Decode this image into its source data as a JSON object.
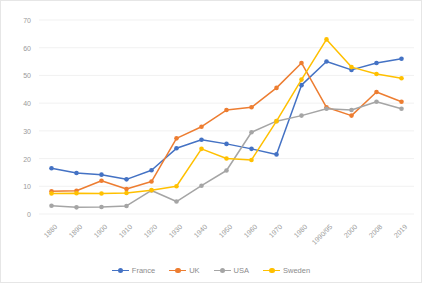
{
  "chart_data": {
    "type": "line",
    "title": "",
    "xlabel": "",
    "ylabel": "",
    "ylim": [
      0,
      70
    ],
    "yticks": [
      0,
      10,
      20,
      30,
      40,
      50,
      60,
      70
    ],
    "grid": true,
    "legend_position": "bottom",
    "categories": [
      "1880",
      "1890",
      "1900",
      "1910",
      "1920",
      "1930",
      "1940",
      "1950",
      "1960",
      "1970",
      "1980",
      "1990/95",
      "2000",
      "2008",
      "2019"
    ],
    "series": [
      {
        "name": "France",
        "color": "#4472C4",
        "values": [
          16.5,
          14.8,
          14.2,
          12.5,
          15.8,
          23.7,
          26.8,
          25.3,
          23.5,
          21.5,
          46.5,
          55.0,
          52.0,
          54.5,
          56.0
        ]
      },
      {
        "name": "UK",
        "color": "#ED7D31",
        "values": [
          8.2,
          8.4,
          12.0,
          9.0,
          11.7,
          27.3,
          31.5,
          37.5,
          38.5,
          45.5,
          54.5,
          38.5,
          35.5,
          44.0,
          40.5
        ]
      },
      {
        "name": "USA",
        "color": "#A5A5A5",
        "values": [
          3.0,
          2.4,
          2.5,
          2.9,
          8.5,
          4.5,
          10.2,
          15.7,
          29.5,
          33.5,
          35.5,
          38.0,
          37.5,
          40.5,
          38.0
        ]
      },
      {
        "name": "Sweden",
        "color": "#FFC000",
        "values": [
          7.4,
          7.5,
          7.4,
          7.6,
          8.6,
          10.0,
          23.5,
          20.0,
          19.5,
          33.5,
          48.5,
          63.0,
          53.0,
          50.5,
          49.0
        ]
      }
    ]
  },
  "legend": {
    "items": [
      {
        "label": "France"
      },
      {
        "label": "UK"
      },
      {
        "label": "USA"
      },
      {
        "label": "Sweden"
      }
    ]
  }
}
